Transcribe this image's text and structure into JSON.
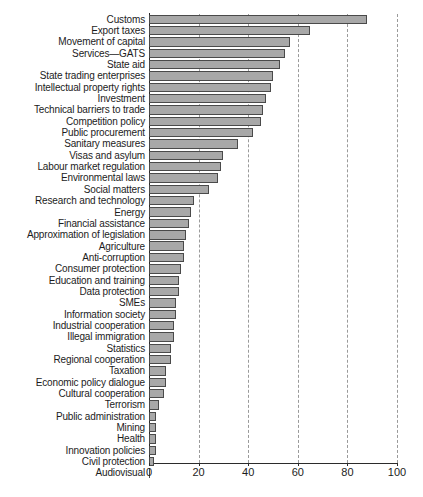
{
  "chart_data": {
    "type": "bar",
    "orientation": "horizontal",
    "title": "",
    "subtitle": "",
    "xlabel": "",
    "ylabel": "",
    "xlim": [
      0,
      100
    ],
    "xticks": [
      0,
      20,
      40,
      60,
      80,
      100
    ],
    "grid": "vertical-dashed",
    "legend": "none",
    "bar_color": "#a8a8a8",
    "bar_edge_color": "#4a4a4a",
    "categories": [
      "Customs",
      "Export taxes",
      "Movement of capital",
      "Services—GATS",
      "State aid",
      "State trading enterprises",
      "Intellectual property rights",
      "Investment",
      "Technical barriers to trade",
      "Competition policy",
      "Public procurement",
      "Sanitary measures",
      "Visas and asylum",
      "Labour market regulation",
      "Environmental laws",
      "Social matters",
      "Research and technology",
      "Energy",
      "Financial assistance",
      "Approximation of legislation",
      "Agriculture",
      "Anti-corruption",
      "Consumer protection",
      "Education and training",
      "Data protection",
      "SMEs",
      "Information society",
      "Industrial cooperation",
      "Illegal immigration",
      "Statistics",
      "Regional cooperation",
      "Taxation",
      "Economic policy dialogue",
      "Cultural cooperation",
      "Terrorism",
      "Public administration",
      "Mining",
      "Health",
      "Innovation policies",
      "Civil protection",
      "Audiovisual"
    ],
    "values": [
      88,
      65,
      57,
      55,
      53,
      50,
      49,
      47,
      46,
      45,
      42,
      36,
      30,
      29,
      28,
      24,
      18,
      17,
      16,
      15,
      14,
      14,
      13,
      12,
      12,
      11,
      11,
      10,
      10,
      9,
      9,
      7,
      7,
      6,
      4,
      3,
      3,
      3,
      3,
      2,
      0
    ]
  }
}
